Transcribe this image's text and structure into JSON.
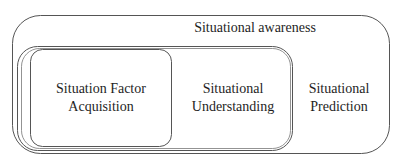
{
  "diagram": {
    "outer": {
      "label": "Situational awareness"
    },
    "middle": {
      "label": "Situational Understanding"
    },
    "inner": {
      "label": "Situation Factor Acquisition"
    },
    "right": {
      "label": "Situational Prediction"
    },
    "line_color": "#555555",
    "background": "#ffffff"
  },
  "labels": {
    "situational_awareness": "Situational awareness",
    "sfa_line1": "Situation Factor",
    "sfa_line2": "Acquisition",
    "su_line1": "Situational",
    "su_line2": "Understanding",
    "sp_line1": "Situational",
    "sp_line2": "Prediction"
  }
}
